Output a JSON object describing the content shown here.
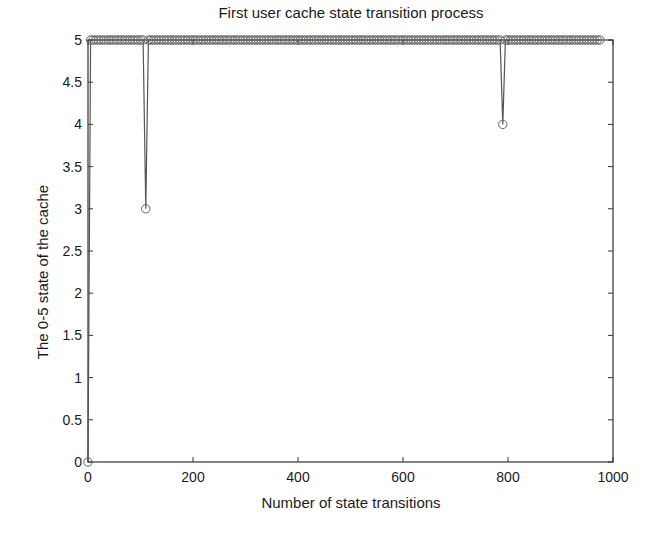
{
  "chart_data": {
    "type": "line",
    "title": "First user cache state transition process",
    "xlabel": "Number of state transitions",
    "ylabel": "The 0-5 state of the cache",
    "xlim": [
      0,
      1000
    ],
    "ylim": [
      0,
      5
    ],
    "xticks": [
      0,
      200,
      400,
      600,
      800,
      1000
    ],
    "yticks": [
      0,
      0.5,
      1,
      1.5,
      2,
      2.5,
      3,
      3.5,
      4,
      4.5,
      5
    ],
    "ytick_labels": [
      "0",
      "0.5",
      "1",
      "1.5",
      "2",
      "2.5",
      "3",
      "3.5",
      "4",
      "4.5",
      "5"
    ],
    "grid": false,
    "legend": null,
    "marker": "circle",
    "line_color": "#555555",
    "series": [
      {
        "name": "cache state",
        "description": "Starts at 0 at x=0, jumps to 5 and stays at 5 for almost all transitions; two dips: to 3 at x≈110 and to 4 at x≈790; data ends near x≈975",
        "points": [
          [
            0,
            0
          ],
          [
            5,
            5
          ],
          [
            105,
            5
          ],
          [
            110,
            3
          ],
          [
            115,
            5
          ],
          [
            785,
            5
          ],
          [
            790,
            4
          ],
          [
            795,
            5
          ],
          [
            975,
            5
          ]
        ]
      }
    ]
  }
}
